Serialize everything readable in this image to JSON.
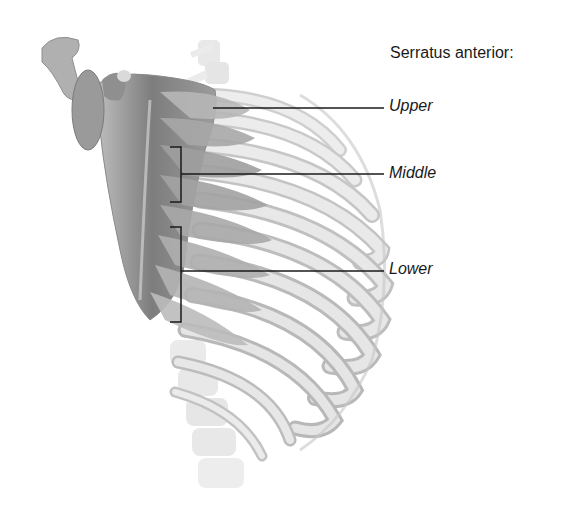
{
  "figure": {
    "title": "Serratus anterior:",
    "labels": [
      {
        "id": "upper",
        "text": "Upper"
      },
      {
        "id": "middle",
        "text": "Middle"
      },
      {
        "id": "lower",
        "text": "Lower"
      }
    ],
    "colors": {
      "bone": "#e6e6e6",
      "bone_shadow": "#b5b5b5",
      "muscle": "#9a9a9a",
      "muscle_dark": "#6e6e6e",
      "leader_line": "#1a1a1a",
      "text": "#1a1a1a"
    }
  }
}
